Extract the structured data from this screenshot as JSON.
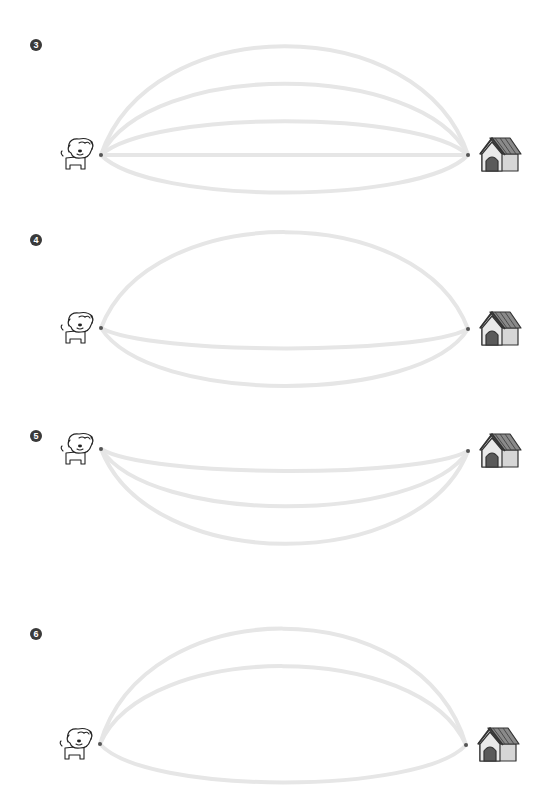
{
  "worksheet": {
    "colors": {
      "path": "#e6e6e6",
      "dot": "#555555",
      "badge": "#3a3a3a",
      "house_roof": "#8a8a8a",
      "house_door": "#5a5a5a",
      "house_wall": "#d6d6d6"
    },
    "sections": [
      {
        "number": "3",
        "start": "dog",
        "end": "doghouse",
        "path_count": 5
      },
      {
        "number": "4",
        "start": "dog",
        "end": "doghouse",
        "path_count": 3
      },
      {
        "number": "5",
        "start": "dog",
        "end": "doghouse",
        "path_count": 3
      },
      {
        "number": "6",
        "start": "dog",
        "end": "doghouse",
        "path_count": 3
      }
    ]
  }
}
